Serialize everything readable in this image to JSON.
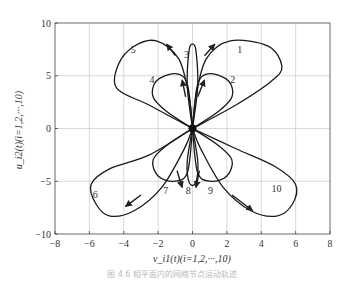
{
  "chart_data": {
    "type": "line",
    "subtype": "phase-plane trajectories",
    "title": "",
    "xlabel": "v_i1(t)(i=1,2,···,10)",
    "ylabel": "u_i2(t)(i=1,2,···,10)",
    "xlim": [
      -8,
      8
    ],
    "ylim": [
      -10,
      10
    ],
    "xticks": [
      -8,
      -6,
      -4,
      -2,
      0,
      2,
      4,
      6,
      8
    ],
    "yticks": [
      -10,
      -5,
      0,
      5,
      10
    ],
    "grid": true,
    "legend": "none (curves labeled inline 1–10)",
    "equilibrium_point": {
      "x": 0,
      "y": 0
    },
    "series": [
      {
        "name": "1",
        "points": [
          [
            0,
            0
          ],
          [
            2.5,
            2.2
          ],
          [
            4.6,
            4.5
          ],
          [
            5.2,
            5.9
          ],
          [
            4.4,
            7.8
          ],
          [
            2.2,
            8.3
          ],
          [
            0.8,
            6.6
          ],
          [
            0.2,
            3
          ],
          [
            0,
            0
          ]
        ],
        "label_pos": [
          2.6,
          7.2
        ]
      },
      {
        "name": "2",
        "points": [
          [
            0,
            0
          ],
          [
            1.5,
            1.6
          ],
          [
            2.3,
            3.0
          ],
          [
            2.1,
            4.5
          ],
          [
            1.0,
            5.2
          ],
          [
            0.3,
            4.2
          ],
          [
            0,
            0
          ]
        ],
        "label_pos": [
          2.2,
          4.3
        ]
      },
      {
        "name": "3",
        "points": [
          [
            0,
            0
          ],
          [
            -0.3,
            4
          ],
          [
            -0.2,
            7.4
          ],
          [
            0,
            8.0
          ],
          [
            0.2,
            7.4
          ],
          [
            0.3,
            4
          ],
          [
            0,
            0
          ]
        ],
        "label_pos": [
          -0.5,
          6.7
        ]
      },
      {
        "name": "4",
        "points": [
          [
            0,
            0
          ],
          [
            -1.5,
            1.6
          ],
          [
            -2.3,
            3.0
          ],
          [
            -2.1,
            4.5
          ],
          [
            -1.0,
            5.2
          ],
          [
            -0.3,
            4.2
          ],
          [
            0,
            0
          ]
        ],
        "label_pos": [
          -2.5,
          4.3
        ]
      },
      {
        "name": "5",
        "points": [
          [
            0,
            0
          ],
          [
            -2.5,
            2.2
          ],
          [
            -4.4,
            3.8
          ],
          [
            -4.3,
            6.1
          ],
          [
            -3.4,
            7.8
          ],
          [
            -2.1,
            8.3
          ],
          [
            -0.8,
            6.6
          ],
          [
            -0.2,
            3
          ],
          [
            0,
            0
          ]
        ],
        "label_pos": [
          -3.6,
          7.2
        ]
      },
      {
        "name": "6",
        "points": [
          [
            0,
            0
          ],
          [
            -2.5,
            -2.5
          ],
          [
            -4.8,
            -3.8
          ],
          [
            -5.9,
            -5.3
          ],
          [
            -5.6,
            -7.2
          ],
          [
            -4.8,
            -8.3
          ],
          [
            -3.4,
            -7.8
          ],
          [
            -1.8,
            -5.6
          ],
          [
            -0.5,
            -2
          ],
          [
            0,
            0
          ]
        ],
        "label_pos": [
          -5.8,
          -6.6
        ]
      },
      {
        "name": "7",
        "points": [
          [
            0,
            0
          ],
          [
            -1.5,
            -1.6
          ],
          [
            -2.3,
            -3.0
          ],
          [
            -2.0,
            -4.5
          ],
          [
            -1.1,
            -5.0
          ],
          [
            -0.3,
            -4.2
          ],
          [
            0,
            0
          ]
        ],
        "label_pos": [
          -1.7,
          -6.2
        ]
      },
      {
        "name": "8",
        "points": [
          [
            0,
            0
          ],
          [
            -0.3,
            -3
          ],
          [
            -0.25,
            -4.8
          ],
          [
            0,
            -5.4
          ],
          [
            0.25,
            -4.8
          ],
          [
            0.3,
            -3
          ],
          [
            0,
            0
          ]
        ],
        "label_pos": [
          -0.4,
          -6.2
        ]
      },
      {
        "name": "9",
        "points": [
          [
            0,
            0
          ],
          [
            1.5,
            -1.6
          ],
          [
            2.3,
            -3.0
          ],
          [
            2.0,
            -4.5
          ],
          [
            1.1,
            -5.0
          ],
          [
            0.3,
            -4.2
          ],
          [
            0,
            0
          ]
        ],
        "label_pos": [
          0.9,
          -6.2
        ]
      },
      {
        "name": "10",
        "points": [
          [
            0,
            0
          ],
          [
            2.5,
            -1.9
          ],
          [
            4.8,
            -3.6
          ],
          [
            6.0,
            -5.3
          ],
          [
            5.8,
            -7.2
          ],
          [
            4.9,
            -8.3
          ],
          [
            3.4,
            -7.8
          ],
          [
            1.8,
            -5.6
          ],
          [
            0.5,
            -2
          ],
          [
            0,
            0
          ]
        ],
        "label_pos": [
          4.6,
          -6.0
        ]
      }
    ],
    "arrows": [
      {
        "from": [
          -1.0,
          6.9
        ],
        "to": [
          -1.5,
          8.0
        ]
      },
      {
        "from": [
          0.7,
          6.9
        ],
        "to": [
          1.3,
          8.0
        ]
      },
      {
        "from": [
          -0.4,
          3.0
        ],
        "to": [
          -0.6,
          4.6
        ]
      },
      {
        "from": [
          0.3,
          3.0
        ],
        "to": [
          0.7,
          4.6
        ]
      },
      {
        "from": [
          -0.9,
          -4.0
        ],
        "to": [
          -0.6,
          -5.6
        ]
      },
      {
        "from": [
          0.4,
          -4.0
        ],
        "to": [
          0.2,
          -5.6
        ]
      },
      {
        "from": [
          -3.0,
          -6.3
        ],
        "to": [
          -3.9,
          -7.4
        ]
      },
      {
        "from": [
          2.3,
          -6.3
        ],
        "to": [
          3.5,
          -7.8
        ]
      }
    ]
  },
  "caption": "图 4.6 相平面内的网络节点运动轨迹"
}
